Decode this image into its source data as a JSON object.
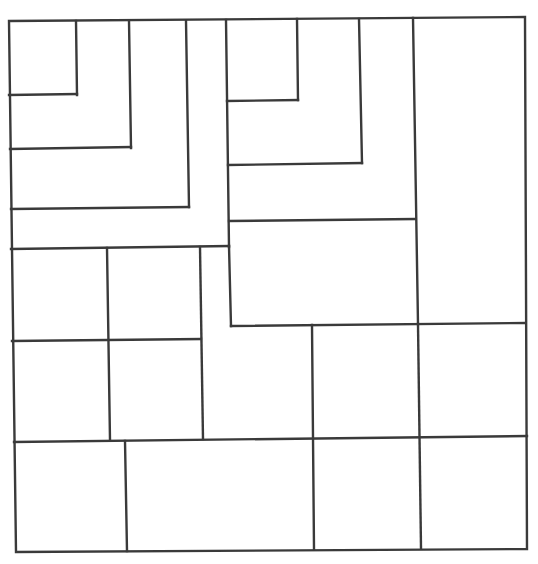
{
  "diagram": {
    "type": "rectangle-dissection",
    "line_color": "#3a3a3a",
    "background": "#ffffff",
    "outer_frame": {
      "x1": 9,
      "y1": 21,
      "x2": 525,
      "y2": 551
    },
    "segments": [
      {
        "id": "tl-inner-right",
        "x1": 76,
        "y1": 21,
        "x2": 77,
        "y2": 95
      },
      {
        "id": "tl-inner-bottom",
        "x1": 9,
        "y1": 95,
        "x2": 77,
        "y2": 94
      },
      {
        "id": "tl-band2-right",
        "x1": 129,
        "y1": 21,
        "x2": 131,
        "y2": 148
      },
      {
        "id": "tl-band2-bottom",
        "x1": 10,
        "y1": 149,
        "x2": 131,
        "y2": 147
      },
      {
        "id": "tl-band3-right",
        "x1": 186,
        "y1": 21,
        "x2": 189,
        "y2": 207
      },
      {
        "id": "tl-band3-bottom",
        "x1": 11,
        "y1": 209,
        "x2": 189,
        "y2": 207
      },
      {
        "id": "tl-band4-right",
        "x1": 226,
        "y1": 20,
        "x2": 229,
        "y2": 247
      },
      {
        "id": "tl-band4-bottom",
        "x1": 11,
        "y1": 249,
        "x2": 229,
        "y2": 246
      },
      {
        "id": "tr-inner-right",
        "x1": 297,
        "y1": 19,
        "x2": 298,
        "y2": 100
      },
      {
        "id": "tr-inner-bottom",
        "x1": 227,
        "y1": 101,
        "x2": 298,
        "y2": 100
      },
      {
        "id": "tr-band2-right",
        "x1": 359,
        "y1": 19,
        "x2": 362,
        "y2": 163
      },
      {
        "id": "tr-band2-bottom",
        "x1": 228,
        "y1": 165,
        "x2": 362,
        "y2": 163
      },
      {
        "id": "tr-column-left",
        "x1": 413,
        "y1": 18,
        "x2": 418,
        "y2": 324
      },
      {
        "id": "tr-band3-bottom",
        "x1": 229,
        "y1": 221,
        "x2": 415,
        "y2": 219
      },
      {
        "id": "mid-block-left",
        "x1": 229,
        "y1": 246,
        "x2": 231,
        "y2": 326
      },
      {
        "id": "mid-block-bottom",
        "x1": 231,
        "y1": 326,
        "x2": 525,
        "y2": 323
      },
      {
        "id": "mid-col-1",
        "x1": 107,
        "y1": 248,
        "x2": 110,
        "y2": 440
      },
      {
        "id": "mid-col-2",
        "x1": 200,
        "y1": 247,
        "x2": 203,
        "y2": 439
      },
      {
        "id": "mid-row-1",
        "x1": 12,
        "y1": 341,
        "x2": 201,
        "y2": 339
      },
      {
        "id": "mid-col-3",
        "x1": 312,
        "y1": 325,
        "x2": 314,
        "y2": 549
      },
      {
        "id": "mid-col-4",
        "x1": 418,
        "y1": 324,
        "x2": 421,
        "y2": 548
      },
      {
        "id": "low-row",
        "x1": 14,
        "y1": 442,
        "x2": 527,
        "y2": 436
      },
      {
        "id": "bottom-col-1",
        "x1": 125,
        "y1": 441,
        "x2": 127,
        "y2": 551
      }
    ]
  }
}
